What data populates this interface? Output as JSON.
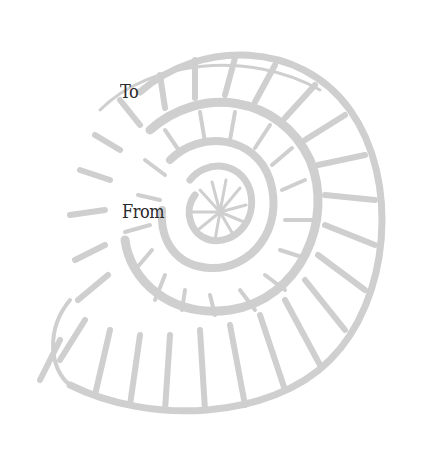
{
  "tag": {
    "to_label": "To",
    "from_label": "From"
  },
  "illustration": {
    "subject": "ammonite-shell",
    "color": "#cfcfcf"
  },
  "colors": {
    "background": "#ffffff",
    "text": "#2a2a2a",
    "shell": "#cfcfcf"
  }
}
